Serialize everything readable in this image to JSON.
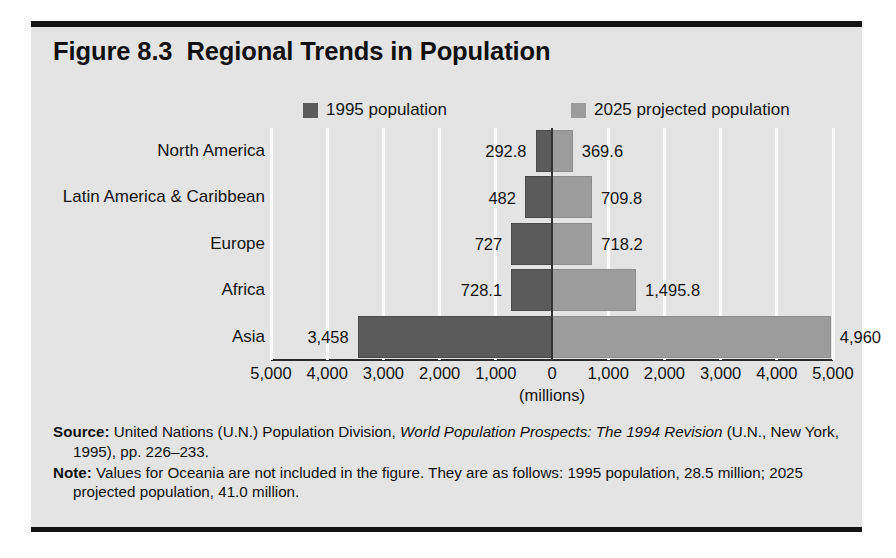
{
  "figure": {
    "title": "Figure 8.3  Regional Trends in Population"
  },
  "legend": [
    {
      "label": "1995 population",
      "color": "#5b5b5b",
      "key": "pop1995"
    },
    {
      "label": "2025 projected population",
      "color": "#9c9c9c",
      "key": "pop2025"
    }
  ],
  "axis": {
    "units": "(millions)",
    "tick_labels": [
      "5,000",
      "4,000",
      "3,000",
      "2,000",
      "1,000",
      "0",
      "1,000",
      "2,000",
      "3,000",
      "4,000",
      "5,000"
    ]
  },
  "footnotes": {
    "source_label": "Source:",
    "source_text_1": " United Nations (U.N.) Population Division, ",
    "source_italic": "World Population Prospects: The 1994 Revision",
    "source_text_2": " (U.N., New York, 1995), pp. 226–233.",
    "note_label": "Note:",
    "note_text": " Values for Oceania are not included in the figure. They are as follows: 1995 population, 28.5 million; 2025 projected population, 41.0 million."
  },
  "chart_data": {
    "type": "bar",
    "orientation": "horizontal",
    "layout": "back-to-back population pyramid",
    "title": "Figure 8.3  Regional Trends in Population",
    "xlabel": "(millions)",
    "ylabel": "",
    "categories": [
      "North America",
      "Latin America & Caribbean",
      "Europe",
      "Africa",
      "Asia"
    ],
    "series": [
      {
        "name": "1995 population",
        "color": "#5b5b5b",
        "side": "left",
        "values": [
          292.8,
          482,
          727,
          728.1,
          3458
        ],
        "labels": [
          "292.8",
          "482",
          "727",
          "728.1",
          "3,458"
        ]
      },
      {
        "name": "2025 projected population",
        "color": "#9c9c9c",
        "side": "right",
        "values": [
          369.6,
          709.8,
          718.2,
          1495.8,
          4960
        ],
        "labels": [
          "369.6",
          "709.8",
          "718.2",
          "1,495.8",
          "4,960"
        ]
      }
    ],
    "xlim": [
      -5000,
      5000
    ],
    "xticks": [
      -5000,
      -4000,
      -3000,
      -2000,
      -1000,
      0,
      1000,
      2000,
      3000,
      4000,
      5000
    ],
    "xtick_labels": [
      "5,000",
      "4,000",
      "3,000",
      "2,000",
      "1,000",
      "0",
      "1,000",
      "2,000",
      "3,000",
      "4,000",
      "5,000"
    ],
    "grid": true,
    "grid_color": "#fbfbfb",
    "legend_position": "top",
    "excluded_region": {
      "name": "Oceania",
      "pop1995": 28.5,
      "pop2025": 41.0
    }
  }
}
